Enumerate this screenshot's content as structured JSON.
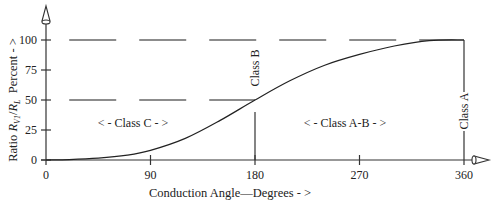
{
  "chart_data": {
    "type": "line",
    "title": "",
    "xlabel": "Conduction Angle—Degrees - >",
    "ylabel_parts": {
      "prefix": "Ratio ",
      "r1": "R",
      "sub1": "V1",
      "slash": "/",
      "r2": "R",
      "sub2": "L",
      "suffix": "  Percent - >"
    },
    "xlim": [
      0,
      360
    ],
    "ylim": [
      0,
      100
    ],
    "x_ticks": [
      0,
      90,
      180,
      270,
      360
    ],
    "x_tick_labels": [
      "0",
      "90",
      "180",
      "270",
      "360"
    ],
    "y_ticks": [
      0,
      25,
      50,
      75,
      100
    ],
    "y_tick_labels": [
      "0",
      "25",
      "50",
      "75",
      "100"
    ],
    "grid": false,
    "legend": null,
    "series": [
      {
        "name": "Ratio RV1/RL",
        "x": [
          0,
          20,
          45,
          70,
          90,
          120,
          150,
          180,
          210,
          240,
          270,
          300,
          330,
          360
        ],
        "y": [
          0,
          0.3,
          1.5,
          4,
          8,
          18,
          33,
          50,
          66,
          79,
          88,
          95,
          99.5,
          100
        ]
      }
    ],
    "reference_lines": [
      {
        "type": "horizontal-dashed",
        "y": 100,
        "x_range": [
          20,
          360
        ]
      },
      {
        "type": "horizontal-dashed",
        "y": 50,
        "x_range": [
          20,
          180
        ]
      },
      {
        "type": "vertical",
        "x": 180,
        "y_range": [
          0,
          40
        ],
        "label": "Class B"
      },
      {
        "type": "vertical",
        "x": 360,
        "y_range": [
          -4,
          100
        ],
        "label": "Class A"
      }
    ],
    "annotations": [
      {
        "text": "< - Class C - >",
        "x": 90,
        "y": 31
      },
      {
        "text": "< - Class A-B - >",
        "x": 270,
        "y": 31
      },
      {
        "text": "Class B",
        "x": 180,
        "y": 77,
        "rotation": -90
      },
      {
        "text": "Class A",
        "x": 360,
        "y": 30,
        "rotation": -90
      }
    ]
  }
}
